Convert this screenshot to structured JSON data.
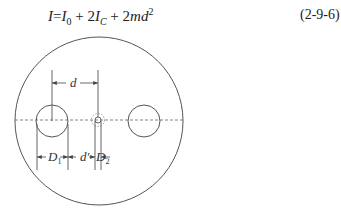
{
  "equation": {
    "lhs": "I",
    "eq": "=",
    "t1_base": "I",
    "t1_sub": "0",
    "plus1": " + 2",
    "t2_base": "I",
    "t2_sub": "C",
    "plus2": " + 2",
    "t3_base": "md",
    "t3_sup": "2",
    "number": "(2-9-6)"
  },
  "diagram": {
    "labels": {
      "d": "d",
      "D1": "D",
      "D1_sub": "1",
      "d_prime": "d'",
      "D2": "D",
      "D2_sub": "2"
    },
    "colors": {
      "stroke": "#555555",
      "background": "#ffffff"
    }
  }
}
